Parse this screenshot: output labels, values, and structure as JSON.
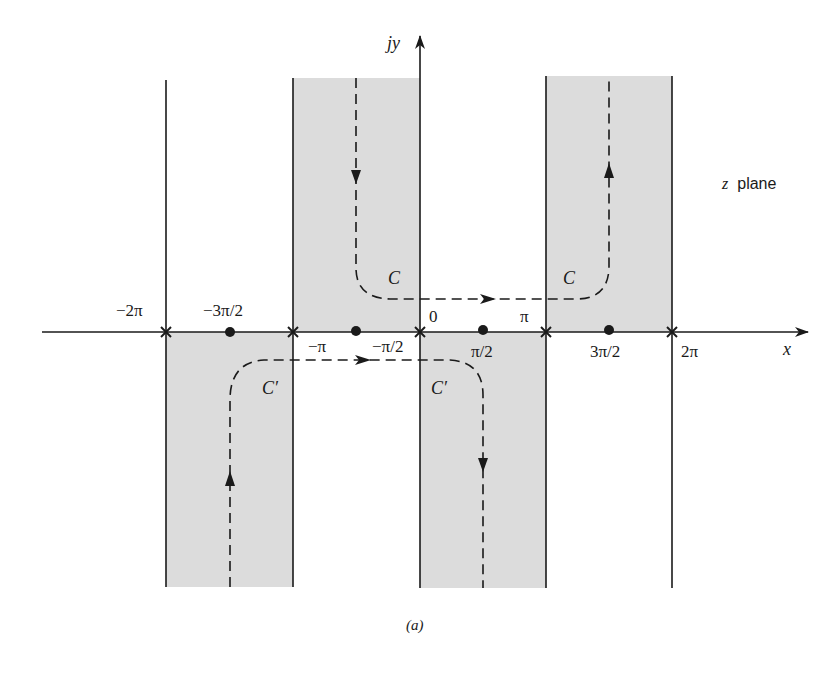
{
  "figure": {
    "plane_label_var": "z",
    "plane_label_word": "plane",
    "caption": "(a)",
    "x_axis_label": "x",
    "y_axis_label": "jy",
    "colors": {
      "shade": "#dcdcdc",
      "line": "#1a1a1a",
      "background": "#ffffff"
    }
  },
  "ticks": {
    "poles_x": [
      {
        "label": "−2π",
        "value": "-2pi"
      },
      {
        "label": "−π",
        "value": "-pi"
      },
      {
        "label": "0",
        "value": "0"
      },
      {
        "label": "π",
        "value": "pi"
      },
      {
        "label": "2π",
        "value": "2pi"
      }
    ],
    "zeros_dots": [
      {
        "label": "−3π/2",
        "value": "-3pi/2"
      },
      {
        "label": "−π/2",
        "value": "-pi/2"
      },
      {
        "label": "π/2",
        "value": "pi/2"
      },
      {
        "label": "3π/2",
        "value": "3pi/2"
      }
    ]
  },
  "regions": [
    {
      "name": "upper-strip-left",
      "x_range": "[-pi, 0]",
      "half_plane": "upper"
    },
    {
      "name": "upper-strip-right",
      "x_range": "[pi, 2pi]",
      "half_plane": "upper"
    },
    {
      "name": "lower-strip-left",
      "x_range": "[-2pi, -pi]",
      "half_plane": "lower"
    },
    {
      "name": "lower-strip-right",
      "x_range": "[0, pi]",
      "half_plane": "lower"
    }
  ],
  "contours": {
    "upper": {
      "label": "C",
      "direction": "down at -pi/2, right along just above axis, up at 3pi/2"
    },
    "lower": {
      "label": "C′",
      "direction": "up at -3pi/2, right along just below axis, down at pi/2"
    }
  }
}
